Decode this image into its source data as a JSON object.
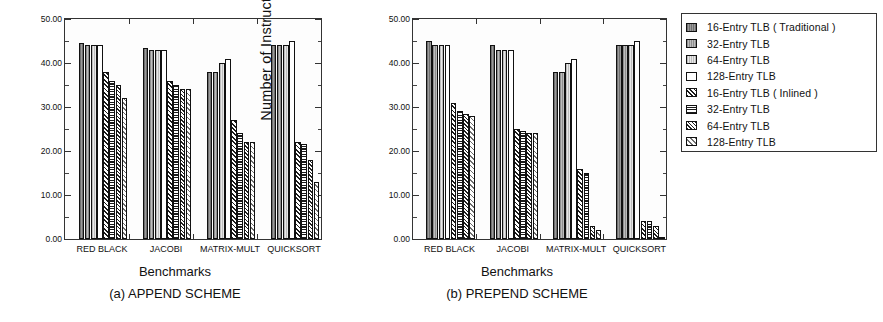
{
  "figure": {
    "axis_title_y": "Number of  Instructions  Flushed",
    "axis_title_x": "Benchmarks"
  },
  "legend": {
    "items": [
      {
        "label": "16-Entry TLB ( Traditional )",
        "fill": "solid-dark-gray",
        "color": "#8a8a8a"
      },
      {
        "label": "32-Entry TLB",
        "fill": "solid-mid-gray",
        "color": "#a8a8a8"
      },
      {
        "label": "64-Entry TLB",
        "fill": "solid-light-gray",
        "color": "#d2d2d2"
      },
      {
        "label": " 128-Entry TLB",
        "fill": "solid-white",
        "color": "#ffffff"
      },
      {
        "label": "16-Entry TLB ( Inlined )",
        "fill": "diagonal-hatch",
        "color": "#1b1b1b"
      },
      {
        "label": "32-Entry TLB",
        "fill": "horizontal-lines",
        "color": "#1b1b1b"
      },
      {
        "label": "64-Entry TLB",
        "fill": "cross-hatch-dots",
        "color": "#222222"
      },
      {
        "label": "128-Entry TLB",
        "fill": "light-diagonal",
        "color": "#6e6e6e"
      }
    ]
  },
  "charts": [
    {
      "id": "a",
      "caption": "(a) APPEND SCHEME",
      "ylabel": "Number of  Instructions  Flushed",
      "xlabel": "Benchmarks",
      "yticks": [
        "0.00",
        "10.00",
        "20.00",
        "30.00",
        "40.00",
        "50.00"
      ],
      "categories": [
        "RED BLACK",
        "JACOBI",
        "MATRIX-MULT",
        "QUICKSORT"
      ],
      "series": [
        {
          "name": "16-Entry TLB ( Traditional )",
          "values": [
            44.5,
            43.5,
            38.0,
            44.0
          ]
        },
        {
          "name": "32-Entry TLB",
          "values": [
            44.0,
            43.0,
            38.0,
            44.0
          ]
        },
        {
          "name": "64-Entry TLB",
          "values": [
            44.0,
            43.0,
            40.0,
            44.0
          ]
        },
        {
          "name": " 128-Entry TLB",
          "values": [
            44.0,
            43.0,
            41.0,
            45.0
          ]
        },
        {
          "name": "16-Entry TLB ( Inlined )",
          "values": [
            38.0,
            36.0,
            27.0,
            22.0
          ]
        },
        {
          "name": "32-Entry TLB",
          "values": [
            36.0,
            35.0,
            24.0,
            21.5
          ]
        },
        {
          "name": "64-Entry TLB",
          "values": [
            35.0,
            34.0,
            22.0,
            18.0
          ]
        },
        {
          "name": "128-Entry TLB",
          "values": [
            32.0,
            34.0,
            22.0,
            13.0
          ]
        }
      ]
    },
    {
      "id": "b",
      "caption": "(b) PREPEND SCHEME",
      "ylabel": "Number of  Instructions  Flushed",
      "xlabel": "Benchmarks",
      "yticks": [
        "0.00",
        "10.00",
        "20.00",
        "30.00",
        "40.00",
        "50.00"
      ],
      "categories": [
        "RED BLACK",
        "JACOBI",
        "MATRIX-MULT",
        "QUICKSORT"
      ],
      "series": [
        {
          "name": "16-Entry TLB ( Traditional )",
          "values": [
            45.0,
            44.0,
            38.0,
            44.0
          ]
        },
        {
          "name": "32-Entry TLB",
          "values": [
            44.0,
            43.0,
            38.0,
            44.0
          ]
        },
        {
          "name": "64-Entry TLB",
          "values": [
            44.0,
            43.0,
            40.0,
            44.0
          ]
        },
        {
          "name": " 128-Entry TLB",
          "values": [
            44.0,
            43.0,
            41.0,
            45.0
          ]
        },
        {
          "name": "16-Entry TLB ( Inlined )",
          "values": [
            31.0,
            25.0,
            16.0,
            4.0
          ]
        },
        {
          "name": "32-Entry TLB",
          "values": [
            29.0,
            24.5,
            15.0,
            4.0
          ]
        },
        {
          "name": "64-Entry TLB",
          "values": [
            28.5,
            24.0,
            3.0,
            3.0
          ]
        },
        {
          "name": "128-Entry TLB",
          "values": [
            28.0,
            24.0,
            2.0,
            0.2
          ]
        }
      ]
    }
  ],
  "chart_data": {
    "type": "bar",
    "title": "",
    "subtitle": "",
    "xlabel": "Benchmarks",
    "ylabel": "Number of  Instructions  Flushed",
    "ylim": [
      0,
      50
    ],
    "ytick_values": [
      0,
      10,
      20,
      30,
      40,
      50
    ],
    "ytick_labels": [
      "0.00",
      "10.00",
      "20.00",
      "30.00",
      "40.00",
      "50.00"
    ],
    "grid": false,
    "legend_position": "right-outside",
    "legend_entries": [
      "16-Entry TLB ( Traditional )",
      "32-Entry TLB",
      "64-Entry TLB",
      " 128-Entry TLB",
      "16-Entry TLB ( Inlined )",
      "32-Entry TLB",
      "64-Entry TLB",
      "128-Entry TLB"
    ],
    "panels": [
      {
        "panel": "(a) APPEND SCHEME",
        "categories": [
          "RED BLACK",
          "JACOBI",
          "MATRIX-MULT",
          "QUICKSORT"
        ],
        "series": [
          {
            "name": "16-Entry TLB ( Traditional )",
            "values": [
              44.5,
              43.5,
              38.0,
              44.0
            ]
          },
          {
            "name": "32-Entry TLB",
            "values": [
              44.0,
              43.0,
              38.0,
              44.0
            ]
          },
          {
            "name": "64-Entry TLB",
            "values": [
              44.0,
              43.0,
              40.0,
              44.0
            ]
          },
          {
            "name": "128-Entry TLB",
            "values": [
              44.0,
              43.0,
              41.0,
              45.0
            ]
          },
          {
            "name": "16-Entry TLB ( Inlined )",
            "values": [
              38.0,
              36.0,
              27.0,
              22.0
            ]
          },
          {
            "name": "32-Entry TLB (Inlined)",
            "values": [
              36.0,
              35.0,
              24.0,
              21.5
            ]
          },
          {
            "name": "64-Entry TLB (Inlined)",
            "values": [
              35.0,
              34.0,
              22.0,
              18.0
            ]
          },
          {
            "name": "128-Entry TLB (Inlined)",
            "values": [
              32.0,
              34.0,
              22.0,
              13.0
            ]
          }
        ]
      },
      {
        "panel": "(b) PREPEND SCHEME",
        "categories": [
          "RED BLACK",
          "JACOBI",
          "MATRIX-MULT",
          "QUICKSORT"
        ],
        "series": [
          {
            "name": "16-Entry TLB ( Traditional )",
            "values": [
              45.0,
              44.0,
              38.0,
              44.0
            ]
          },
          {
            "name": "32-Entry TLB",
            "values": [
              44.0,
              43.0,
              38.0,
              44.0
            ]
          },
          {
            "name": "64-Entry TLB",
            "values": [
              44.0,
              43.0,
              40.0,
              44.0
            ]
          },
          {
            "name": "128-Entry TLB",
            "values": [
              44.0,
              43.0,
              41.0,
              45.0
            ]
          },
          {
            "name": "16-Entry TLB ( Inlined )",
            "values": [
              31.0,
              25.0,
              16.0,
              4.0
            ]
          },
          {
            "name": "32-Entry TLB (Inlined)",
            "values": [
              29.0,
              24.5,
              15.0,
              4.0
            ]
          },
          {
            "name": "64-Entry TLB (Inlined)",
            "values": [
              28.5,
              24.0,
              3.0,
              3.0
            ]
          },
          {
            "name": "128-Entry TLB (Inlined)",
            "values": [
              28.0,
              24.0,
              2.0,
              0.2
            ]
          }
        ]
      }
    ]
  }
}
